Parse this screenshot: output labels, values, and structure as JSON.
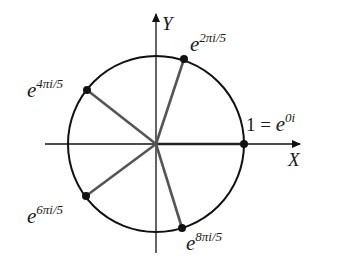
{
  "diagram": {
    "axes": {
      "x_label": "X",
      "y_label": "Y"
    },
    "center": [
      156,
      144
    ],
    "radius": 88,
    "points": [
      {
        "name": "e0",
        "base": "e",
        "exponent": "0i",
        "prefix": "1 = ",
        "angle_deg": 0
      },
      {
        "name": "e2",
        "base": "e",
        "exponent": "2πi/5",
        "prefix": "",
        "angle_deg": 72
      },
      {
        "name": "e4",
        "base": "e",
        "exponent": "4πi/5",
        "prefix": "",
        "angle_deg": 144
      },
      {
        "name": "e6",
        "base": "e",
        "exponent": "6πi/5",
        "prefix": "",
        "angle_deg": 216
      },
      {
        "name": "e8",
        "base": "e",
        "exponent": "8πi/5",
        "prefix": "",
        "angle_deg": 288
      }
    ],
    "colors": {
      "circle": "#111111",
      "spokes": "#555555",
      "axes": "#111111"
    }
  }
}
